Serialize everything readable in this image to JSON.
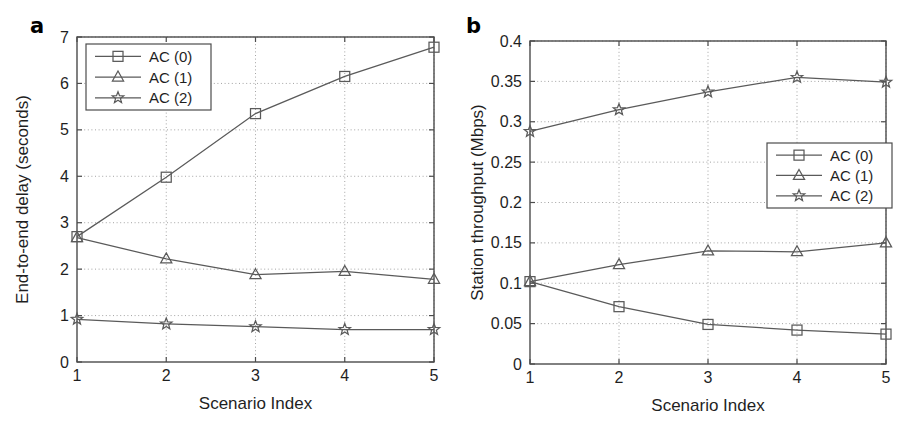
{
  "figure": {
    "background": "#ffffff",
    "line_color": "#5a5a5a",
    "axis_color": "#4c4c4c",
    "grid_color": "#9a9a9a"
  },
  "panels": [
    {
      "id": "a",
      "label": "a",
      "legend_position": "top-left",
      "chart_ref": 0
    },
    {
      "id": "b",
      "label": "b",
      "legend_position": "middle-right",
      "chart_ref": 1
    }
  ],
  "chart_data": [
    {
      "type": "line",
      "panel": "a",
      "title": "",
      "xlabel": "Scenario Index",
      "ylabel": "End-to-end delay (seconds)",
      "x": [
        1,
        2,
        3,
        4,
        5
      ],
      "xlim": [
        1,
        5
      ],
      "ylim": [
        0,
        7
      ],
      "xticks": [
        1,
        2,
        3,
        4,
        5
      ],
      "xtick_labels": [
        "1",
        "2",
        "3",
        "4",
        "5"
      ],
      "yticks": [
        0,
        1,
        2,
        3,
        4,
        5,
        6,
        7
      ],
      "ytick_labels": [
        "0",
        "1",
        "2",
        "3",
        "4",
        "5",
        "6",
        "7"
      ],
      "grid": true,
      "legend_position": "upper left",
      "series": [
        {
          "name": "AC (0)",
          "marker": "square",
          "values": [
            2.7,
            3.98,
            5.35,
            6.15,
            6.78
          ]
        },
        {
          "name": "AC (1)",
          "marker": "triangle",
          "values": [
            2.68,
            2.22,
            1.88,
            1.95,
            1.78
          ]
        },
        {
          "name": "AC (2)",
          "marker": "star",
          "values": [
            0.92,
            0.82,
            0.76,
            0.7,
            0.7
          ]
        }
      ]
    },
    {
      "type": "line",
      "panel": "b",
      "title": "",
      "xlabel": "Scenario Index",
      "ylabel": "Station throughput (Mbps)",
      "x": [
        1,
        2,
        3,
        4,
        5
      ],
      "xlim": [
        1,
        5
      ],
      "ylim": [
        0,
        0.4
      ],
      "xticks": [
        1,
        2,
        3,
        4,
        5
      ],
      "xtick_labels": [
        "1",
        "2",
        "3",
        "4",
        "5"
      ],
      "yticks": [
        0,
        0.05,
        0.1,
        0.15,
        0.2,
        0.25,
        0.3,
        0.35,
        0.4
      ],
      "ytick_labels": [
        "0",
        "0.05",
        "0.1",
        "0.15",
        "0.2",
        "0.25",
        "0.3",
        "0.35",
        "0.4"
      ],
      "grid": true,
      "legend_position": "center right",
      "series": [
        {
          "name": "AC (0)",
          "marker": "square",
          "values": [
            0.102,
            0.071,
            0.049,
            0.042,
            0.037
          ]
        },
        {
          "name": "AC (1)",
          "marker": "triangle",
          "values": [
            0.102,
            0.123,
            0.14,
            0.139,
            0.15
          ]
        },
        {
          "name": "AC (2)",
          "marker": "star",
          "values": [
            0.288,
            0.315,
            0.337,
            0.355,
            0.349
          ]
        }
      ]
    }
  ]
}
